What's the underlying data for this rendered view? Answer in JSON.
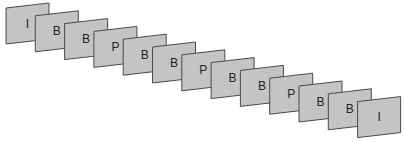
{
  "diagram": {
    "type": "gop-frame-sequence",
    "colors": {
      "fill": "#c4c4c4",
      "stroke": "#4a4a4a",
      "text": "#222222",
      "background": "#ffffff"
    },
    "frames": [
      {
        "label": "I"
      },
      {
        "label": "B"
      },
      {
        "label": "B"
      },
      {
        "label": "P"
      },
      {
        "label": "B"
      },
      {
        "label": "B"
      },
      {
        "label": "P"
      },
      {
        "label": "B"
      },
      {
        "label": "B"
      },
      {
        "label": "P"
      },
      {
        "label": "B"
      },
      {
        "label": "B"
      },
      {
        "label": "I"
      }
    ]
  }
}
